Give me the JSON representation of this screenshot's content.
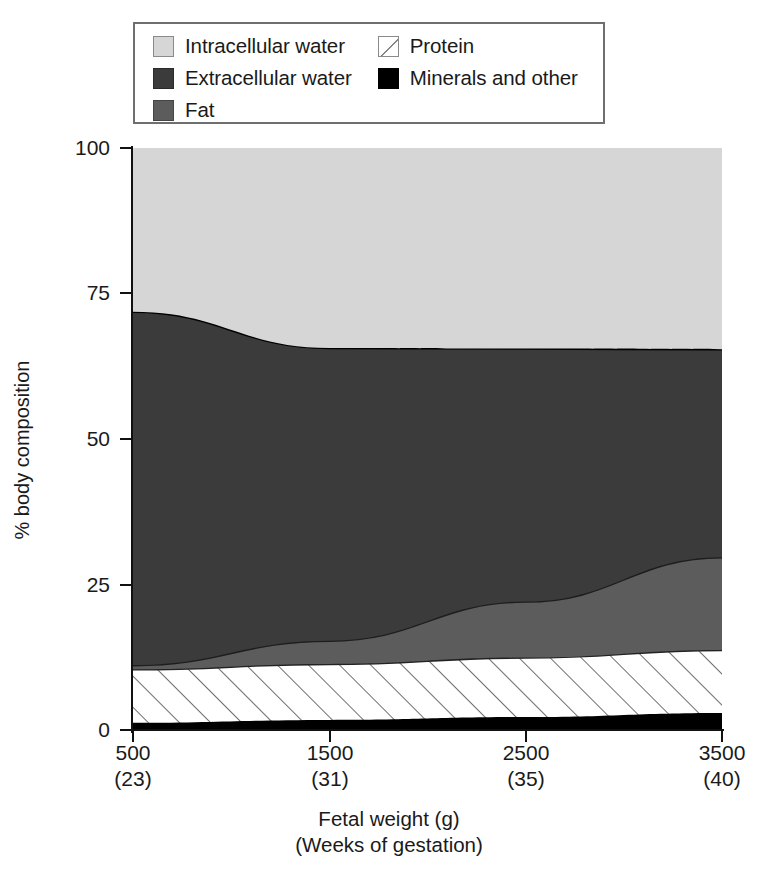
{
  "legend": {
    "columns": [
      [
        {
          "label": "Intracellular water",
          "key": "icw",
          "swatch": "light-gray-square",
          "color": "#d6d6d6"
        },
        {
          "label": "Extracellular water",
          "key": "ecw",
          "swatch": "dark-gray-square",
          "color": "#3b3b3b"
        },
        {
          "label": "Fat",
          "key": "fat",
          "swatch": "medium-gray-square",
          "color": "#5c5c5c"
        }
      ],
      [
        {
          "label": "Protein",
          "key": "protein",
          "swatch": "white-diagonal-hatch-square",
          "color": "#ffffff"
        },
        {
          "label": "Minerals and other",
          "key": "minerals",
          "swatch": "black-square",
          "color": "#000000"
        }
      ]
    ]
  },
  "axes": {
    "y_title": "% body composition",
    "y_ticks": [
      "0",
      "25",
      "50",
      "75",
      "100"
    ],
    "x_title_line1": "Fetal weight (g)",
    "x_title_line2": "(Weeks of gestation)",
    "x_ticks": [
      {
        "weight": "500",
        "weeks": "(23)"
      },
      {
        "weight": "1500",
        "weeks": "(31)"
      },
      {
        "weight": "2500",
        "weeks": "(35)"
      },
      {
        "weight": "3500",
        "weeks": "(40)"
      }
    ]
  },
  "chart_data": {
    "type": "area",
    "title": "",
    "xlabel": "Fetal weight (g) / (Weeks of gestation)",
    "ylabel": "% body composition",
    "ylim": [
      0,
      100
    ],
    "xlim": [
      500,
      3500
    ],
    "grid": false,
    "legend_position": "top",
    "stacked": true,
    "stack_order_bottom_to_top": [
      "Minerals and other",
      "Protein",
      "Fat",
      "Extracellular water",
      "Intracellular water"
    ],
    "x": [
      500,
      1500,
      2500,
      3500
    ],
    "x_weeks": [
      23,
      31,
      35,
      40
    ],
    "series": [
      {
        "name": "Minerals and other",
        "color": "#000000",
        "values": [
          1.4,
          1.9,
          2.4,
          3.1
        ]
      },
      {
        "name": "Protein",
        "color": "#ffffff",
        "pattern": "diagonal-hatch",
        "values": [
          9.2,
          9.6,
          10.2,
          10.8
        ]
      },
      {
        "name": "Fat",
        "color": "#5c5c5c",
        "values": [
          0.7,
          4.0,
          9.6,
          15.9
        ]
      },
      {
        "name": "Extracellular water",
        "color": "#3b3b3b",
        "values": [
          60.6,
          50.2,
          43.4,
          35.7
        ]
      },
      {
        "name": "Intracellular water",
        "color": "#d6d6d6",
        "values": [
          28.1,
          34.3,
          34.4,
          34.5
        ]
      }
    ],
    "cumulative_tops": {
      "minerals": [
        1.4,
        1.9,
        2.4,
        3.1
      ],
      "protein": [
        10.6,
        11.5,
        12.6,
        13.9
      ],
      "fat": [
        11.3,
        15.5,
        22.2,
        29.8
      ],
      "extracellular_water": [
        71.9,
        65.7,
        65.6,
        65.5
      ],
      "intracellular_water": [
        100,
        100,
        100,
        100
      ]
    }
  }
}
